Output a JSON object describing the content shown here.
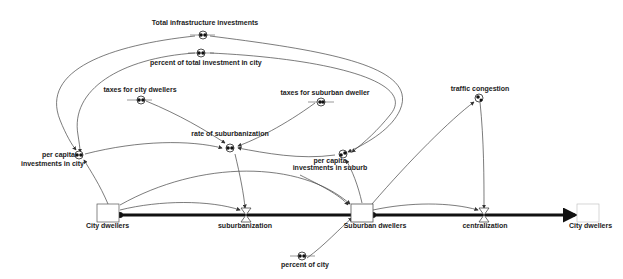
{
  "diagram": {
    "type": "stock-and-flow",
    "stocks": [
      {
        "id": "city_dwellers",
        "label": "City dwellers"
      },
      {
        "id": "suburban_dwellers",
        "label": "Suburban dwellers"
      },
      {
        "id": "city_dwellers_sink",
        "label": "City dwellers"
      }
    ],
    "flows": [
      {
        "id": "suburbanization",
        "label": "suburbanization",
        "from": "City dwellers",
        "to": "Suburban dwellers"
      },
      {
        "id": "centralization",
        "label": "centralization",
        "from": "Suburban dwellers",
        "to": "City dwellers"
      }
    ],
    "converters": [
      {
        "id": "total_infra",
        "label": "Total infrastructure investments"
      },
      {
        "id": "percent_total_city",
        "label": "percent of total investment in city"
      },
      {
        "id": "taxes_city",
        "label": "taxes for city dwellers"
      },
      {
        "id": "taxes_suburban",
        "label": "taxes for suburban dweller"
      },
      {
        "id": "rate_suburbanization",
        "label": "rate of suburbanization"
      },
      {
        "id": "traffic_congestion",
        "label": "traffic congestion"
      },
      {
        "id": "per_capita_city",
        "label_line1": "per capita",
        "label_line2": "investments in city"
      },
      {
        "id": "per_capita_suburb",
        "label_line1": "per capita",
        "label_line2": "investments in suburb"
      },
      {
        "id": "percent_of_city",
        "label": "percent of city"
      }
    ],
    "connectors": [
      {
        "from": "Total infrastructure investments",
        "to": "per capita investments in city"
      },
      {
        "from": "Total infrastructure investments",
        "to": "per capita investments in suburb"
      },
      {
        "from": "percent of total investment in city",
        "to": "per capita investments in city"
      },
      {
        "from": "percent of total investment in city",
        "to": "per capita investments in suburb"
      },
      {
        "from": "taxes for city dwellers",
        "to": "rate of suburbanization"
      },
      {
        "from": "taxes for suburban dweller",
        "to": "rate of suburbanization"
      },
      {
        "from": "per capita investments in city",
        "to": "rate of suburbanization"
      },
      {
        "from": "per capita investments in suburb",
        "to": "rate of suburbanization"
      },
      {
        "from": "City dwellers",
        "to": "per capita investments in city"
      },
      {
        "from": "Suburban dwellers",
        "to": "per capita investments in suburb"
      },
      {
        "from": "rate of suburbanization",
        "to": "suburbanization"
      },
      {
        "from": "City dwellers",
        "to": "suburbanization"
      },
      {
        "from": "City dwellers",
        "to": "Suburban dwellers"
      },
      {
        "from": "Suburban dwellers",
        "to": "traffic congestion"
      },
      {
        "from": "traffic congestion",
        "to": "centralization"
      },
      {
        "from": "Suburban dwellers",
        "to": "centralization"
      },
      {
        "from": "percent of city",
        "to": "Suburban dwellers"
      }
    ]
  },
  "colors": {
    "line": "#333333",
    "flow": "#111111",
    "background": "#ffffff"
  }
}
